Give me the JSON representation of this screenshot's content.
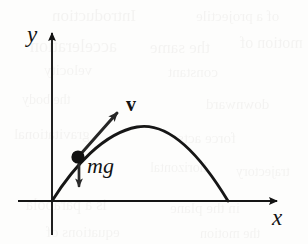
{
  "figure": {
    "background_color": "#fdfdfc",
    "ink_color": "#131313"
  },
  "axes": {
    "x_label": "x",
    "y_label": "y",
    "origin": {
      "x": 52,
      "y": 201
    },
    "x_axis_start_px": 18,
    "x_axis_end_px": 283,
    "y_axis_top_px": 27,
    "y_axis_bottom_px": 235
  },
  "annotations": {
    "velocity_label": "v",
    "weight_label": "mg"
  },
  "ghost_text": {
    "note": "faint show-through text from reverse of scanned page",
    "lines": [
      {
        "text": "Introduction",
        "left": 52,
        "top": 6,
        "size": 17
      },
      {
        "text": "of a projectile",
        "left": 196,
        "top": 8,
        "size": 15
      },
      {
        "text": "acceleration",
        "left": 30,
        "top": 36,
        "size": 18
      },
      {
        "text": "the same",
        "left": 150,
        "top": 38,
        "size": 17
      },
      {
        "text": "motion of",
        "left": 240,
        "top": 34,
        "size": 16
      },
      {
        "text": "velocity",
        "left": 44,
        "top": 62,
        "size": 15
      },
      {
        "text": "constant",
        "left": 168,
        "top": 64,
        "size": 15
      },
      {
        "text": "the body",
        "left": 22,
        "top": 92,
        "size": 14
      },
      {
        "text": "downward",
        "left": 206,
        "top": 96,
        "size": 15
      },
      {
        "text": "gravitational",
        "left": 14,
        "top": 126,
        "size": 15
      },
      {
        "text": "force acts",
        "left": 178,
        "top": 130,
        "size": 15
      },
      {
        "text": "horizontal",
        "left": 150,
        "top": 160,
        "size": 14
      },
      {
        "text": "trajectory",
        "left": 236,
        "top": 164,
        "size": 14
      },
      {
        "text": "is a parabola",
        "left": 26,
        "top": 196,
        "size": 16
      },
      {
        "text": "in the plane",
        "left": 170,
        "top": 200,
        "size": 15
      },
      {
        "text": "equations of",
        "left": 46,
        "top": 224,
        "size": 15
      },
      {
        "text": "the motion",
        "left": 200,
        "top": 226,
        "size": 14
      }
    ]
  },
  "chart_data": {
    "type": "line",
    "xlabel": "x",
    "ylabel": "y",
    "grid": false,
    "legend": null,
    "series": [
      {
        "name": "trajectory",
        "description": "parabolic path of projectile from launch at origin to landing on x-axis",
        "launch_point": [
          0,
          0
        ],
        "landing_point": [
          1,
          0
        ],
        "apex": [
          0.53,
          0.41
        ],
        "path_px": "M 52 201 Q 148 62 228 201"
      }
    ],
    "points": [
      {
        "name": "projectile",
        "label": "",
        "x_px": 78,
        "y_px": 157,
        "radius_px": 6.5,
        "marker": "filled-circle"
      }
    ],
    "vectors": [
      {
        "name": "velocity",
        "label": "v",
        "bold": true,
        "tail_px": [
          79,
          156
        ],
        "head_px": [
          123,
          107
        ],
        "direction": "up-right, tangent to trajectory"
      },
      {
        "name": "weight",
        "label": "mg",
        "italic": true,
        "tail_px": [
          79,
          161
        ],
        "head_px": [
          79,
          193
        ],
        "direction": "straight down"
      }
    ],
    "axis_arrows": [
      {
        "name": "x-axis",
        "from_px": [
          18,
          201
        ],
        "to_px": [
          283,
          201
        ]
      },
      {
        "name": "y-axis",
        "from_px": [
          52,
          235
        ],
        "to_px": [
          52,
          27
        ]
      }
    ]
  }
}
